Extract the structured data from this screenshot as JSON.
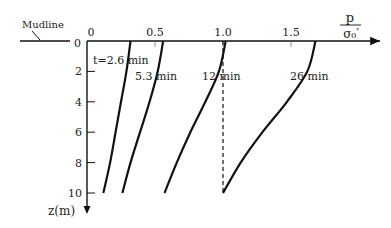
{
  "chart_data": {
    "type": "line",
    "title": "",
    "xlabel_top": "p",
    "xlabel_bottom": "σ₀′",
    "ylabel": "z(m)",
    "annotation": "Mudline",
    "origin_label": "0",
    "x_ticks": [
      "0",
      "0.5",
      "1.0",
      "1.5"
    ],
    "x_tick_values": [
      0,
      0.5,
      1.0,
      1.5
    ],
    "y_ticks": [
      "0",
      "2",
      "4",
      "6",
      "8",
      "10"
    ],
    "y_tick_values": [
      0,
      2,
      4,
      6,
      8,
      10
    ],
    "xlim": [
      0,
      1.9
    ],
    "ylim": [
      0,
      10.5
    ],
    "grid": false,
    "series": [
      {
        "name": "t=2.6 min",
        "label": "t=2.6 min",
        "points": [
          [
            0.32,
            0
          ],
          [
            0.29,
            2
          ],
          [
            0.25,
            4
          ],
          [
            0.21,
            6
          ],
          [
            0.17,
            8
          ],
          [
            0.12,
            10
          ]
        ]
      },
      {
        "name": "5.3 min",
        "label": "5.3 min",
        "points": [
          [
            0.56,
            0
          ],
          [
            0.52,
            2
          ],
          [
            0.46,
            4
          ],
          [
            0.39,
            6
          ],
          [
            0.32,
            8
          ],
          [
            0.26,
            10
          ]
        ]
      },
      {
        "name": "12 min",
        "label": "12 min",
        "points": [
          [
            1.02,
            0
          ],
          [
            0.97,
            2
          ],
          [
            0.87,
            4
          ],
          [
            0.76,
            6
          ],
          [
            0.66,
            8
          ],
          [
            0.57,
            10
          ]
        ]
      },
      {
        "name": "26 min",
        "label": "26 min",
        "points": [
          [
            1.68,
            0
          ],
          [
            1.62,
            2
          ],
          [
            1.47,
            4
          ],
          [
            1.29,
            6
          ],
          [
            1.13,
            8
          ],
          [
            1.0,
            10
          ]
        ]
      }
    ],
    "reference_line": {
      "style": "dashed",
      "x": 1.0,
      "z_range": [
        0,
        10
      ]
    }
  }
}
